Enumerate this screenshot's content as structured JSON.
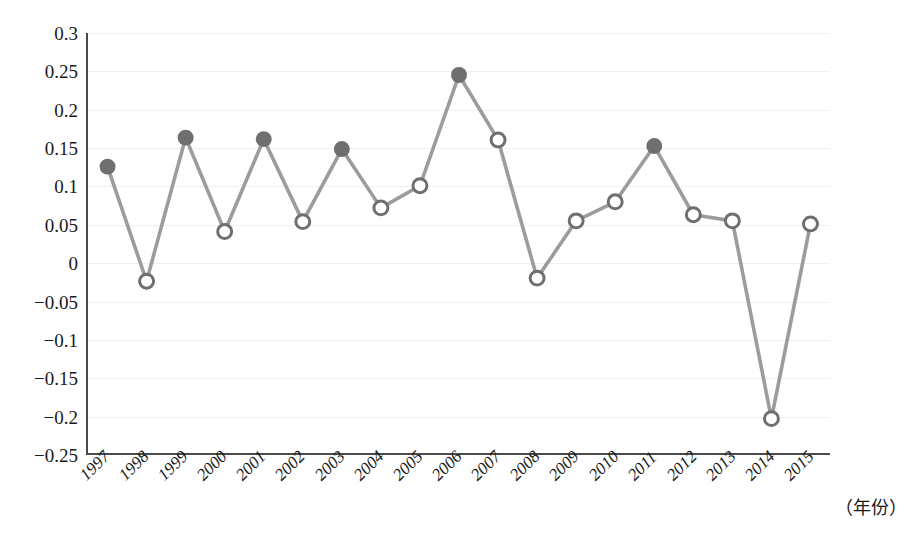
{
  "chart_data": {
    "type": "line",
    "title": "",
    "subtitle": "",
    "xlabel": "（年份）",
    "ylabel": "",
    "categories": [
      "1997",
      "1998",
      "1999",
      "2000",
      "2001",
      "2002",
      "2003",
      "2004",
      "2005",
      "2006",
      "2007",
      "2008",
      "2009",
      "2010",
      "2011",
      "2012",
      "2013",
      "2014",
      "2015"
    ],
    "values": [
      0.125,
      -0.025,
      0.163,
      0.04,
      0.161,
      0.053,
      0.148,
      0.071,
      0.1,
      0.245,
      0.16,
      -0.021,
      0.054,
      0.079,
      0.152,
      0.062,
      0.054,
      -0.205,
      0.05
    ],
    "marker_styles": [
      "filled",
      "hollow",
      "filled",
      "hollow",
      "filled",
      "hollow",
      "filled",
      "hollow",
      "hollow",
      "filled",
      "hollow",
      "hollow",
      "hollow",
      "hollow",
      "filled",
      "hollow",
      "hollow",
      "hollow",
      "hollow"
    ],
    "ylim": [
      -0.25,
      0.3
    ],
    "yticks": [
      "0.3",
      "0.25",
      "0.2",
      "0.15",
      "0.1",
      "0.05",
      "0",
      "−0.05",
      "−0.1",
      "−0.15",
      "−0.2",
      "−0.25"
    ],
    "ytick_values": [
      0.3,
      0.25,
      0.2,
      0.15,
      0.1,
      0.05,
      0,
      -0.05,
      -0.1,
      -0.15,
      -0.2,
      -0.25
    ],
    "grid": true,
    "legend": null,
    "series": [
      {
        "name": "",
        "values": [
          0.125,
          -0.025,
          0.163,
          0.04,
          0.161,
          0.053,
          0.148,
          0.071,
          0.1,
          0.245,
          0.16,
          -0.021,
          0.054,
          0.079,
          0.152,
          0.062,
          0.054,
          -0.205,
          0.05
        ]
      }
    ],
    "colors": {
      "line": "#9c9c9c",
      "marker_fill": "#6f6f6f",
      "marker_hollow_fill": "#ffffff",
      "marker_stroke": "#6f6f6f",
      "axis": "#4a4a4a",
      "grid": "#f0f0f2",
      "text": "#1a1a1a"
    }
  }
}
